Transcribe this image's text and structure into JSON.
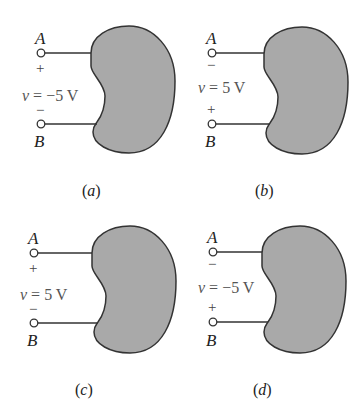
{
  "figure": {
    "colors": {
      "bean_fill": "#a9a9a9",
      "outline": "#333333",
      "text": "#222222"
    },
    "panels": [
      {
        "id": "a",
        "caption": "(a)",
        "caption_letter": "a",
        "terminal_top": "A",
        "terminal_bottom": "B",
        "sign_top": "+",
        "sign_bottom": "−",
        "voltage_var": "v",
        "voltage_value": " = −5 V"
      },
      {
        "id": "b",
        "caption": "(b)",
        "caption_letter": "b",
        "terminal_top": "A",
        "terminal_bottom": "B",
        "sign_top": "−",
        "sign_bottom": "+",
        "voltage_var": "v",
        "voltage_value": " = 5 V"
      },
      {
        "id": "c",
        "caption": "(c)",
        "caption_letter": "c",
        "terminal_top": "A",
        "terminal_bottom": "B",
        "sign_top": "+",
        "sign_bottom": "−",
        "voltage_var": "v",
        "voltage_value": " = 5 V"
      },
      {
        "id": "d",
        "caption": "(d)",
        "caption_letter": "d",
        "terminal_top": "A",
        "terminal_bottom": "B",
        "sign_top": "−",
        "sign_bottom": "+",
        "voltage_var": "v",
        "voltage_value": " = −5 V"
      }
    ],
    "paren_open": "(",
    "paren_close": ")"
  }
}
